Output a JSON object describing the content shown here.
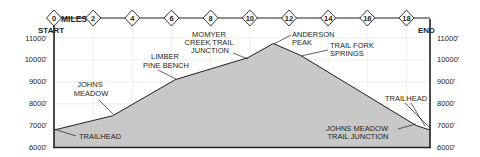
{
  "chart_data": {
    "type": "area",
    "title": "",
    "xlabel": "MILES",
    "ylabel": "",
    "x_unit": "miles",
    "y_unit": "feet",
    "xlim": [
      0,
      19.2
    ],
    "ylim": [
      6000,
      11000
    ],
    "x_ticks": [
      0,
      2,
      4,
      6,
      8,
      10,
      12,
      14,
      16,
      18
    ],
    "x_tick_labels": [
      "0",
      "2",
      "4",
      "6",
      "8",
      "10",
      "12",
      "14",
      "16",
      "18"
    ],
    "y_ticks": [
      6000,
      7000,
      8000,
      9000,
      10000,
      11000
    ],
    "y_tick_labels": [
      "6000'",
      "7000'",
      "8000'",
      "9000'",
      "10000'",
      "11000'"
    ],
    "grid": true,
    "legend": null,
    "start_label": "START",
    "end_label": "END",
    "x": [
      0,
      3.0,
      6.2,
      9.9,
      11.2,
      12.6,
      18.5,
      19.2
    ],
    "y": [
      6800,
      7450,
      9100,
      10100,
      10750,
      10200,
      7000,
      6800
    ],
    "annotations": [
      {
        "text": "TRAILHEAD",
        "x": 0,
        "y": 6800
      },
      {
        "text": "JOHNS MEADOW",
        "x": 3.0,
        "y": 7450
      },
      {
        "text": "LIMBER PINE BENCH",
        "x": 6.2,
        "y": 9100
      },
      {
        "text": "MOMYER CREEK TRAIL JUNCTION",
        "x": 9.9,
        "y": 10100
      },
      {
        "text": "ANDERSON PEAK",
        "x": 11.2,
        "y": 10750
      },
      {
        "text": "TRAIL FORK SPRINGS",
        "x": 12.6,
        "y": 10200
      },
      {
        "text": "JOHNS MEADOW TRAIL JUNCTION",
        "x": 18.5,
        "y": 7000
      },
      {
        "text": "TRAILHEAD",
        "x": 19.2,
        "y": 6800
      }
    ]
  },
  "labels": {
    "miles": "MILES",
    "start": "START",
    "end": "END",
    "trailhead_start": "TRAILHEAD",
    "johns_meadow": [
      "JOHNS",
      "MEADOW"
    ],
    "limber_pine": [
      "LIMBER",
      "PINE BENCH"
    ],
    "momyer": [
      "MOMYER",
      "CREEK TRAIL",
      "JUNCTION"
    ],
    "anderson": [
      "ANDERSON",
      "PEAK"
    ],
    "trail_fork": [
      "TRAIL FORK",
      "SPRINGS"
    ],
    "trailhead_end": "TRAILHEAD",
    "johns_meadow_jct": [
      "JOHNS MEADOW",
      "TRAIL JUNCTION"
    ]
  },
  "colors": {
    "fill": "#c8c8c8",
    "line": "#231f20",
    "grid": "#e3e3e3",
    "text": "#231f20"
  }
}
